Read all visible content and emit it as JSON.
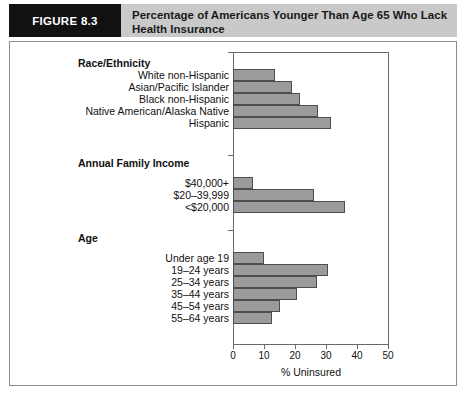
{
  "figure": {
    "tag": "FIGURE 8.3",
    "title": "Percentage of Americans Younger Than Age 65 Who Lack Health Insurance"
  },
  "chart_data": {
    "type": "bar",
    "orientation": "horizontal",
    "title": "Percentage of Americans Younger Than Age 65 Who Lack Health Insurance",
    "xlabel": "% Uninsured",
    "ylabel": "",
    "xlim": [
      0,
      50
    ],
    "xticks": [
      0,
      10,
      20,
      30,
      40,
      50
    ],
    "xticklabels": [
      "0",
      "10",
      "20",
      "30",
      "40",
      "50"
    ],
    "grid": false,
    "legend": false,
    "bar_color": "#9b9b9b",
    "bar_edge_color": "#4d4d4d",
    "groups": [
      {
        "heading": "Race/Ethnicity",
        "categories": [
          "White non-Hispanic",
          "Asian/Pacific Islander",
          "Black non-Hispanic",
          "Native American/Alaska Native",
          "Hispanic"
        ],
        "values": [
          13.5,
          19,
          21.5,
          27.5,
          31.5
        ]
      },
      {
        "heading": "Annual Family Income",
        "categories": [
          "$40,000+",
          "$20–39,999",
          "<$20,000"
        ],
        "values": [
          6.5,
          26,
          36
        ]
      },
      {
        "heading": "Age",
        "categories": [
          "Under age 19",
          "19–24 years",
          "25–34 years",
          "35–44 years",
          "45–54 years",
          "55–64 years"
        ],
        "values": [
          10,
          30.5,
          27,
          20.5,
          15,
          12.5
        ]
      }
    ]
  },
  "colors": {
    "header_band": "#c9c9c9",
    "tag_block": "#111111",
    "frame_border": "#8d8d8d"
  }
}
